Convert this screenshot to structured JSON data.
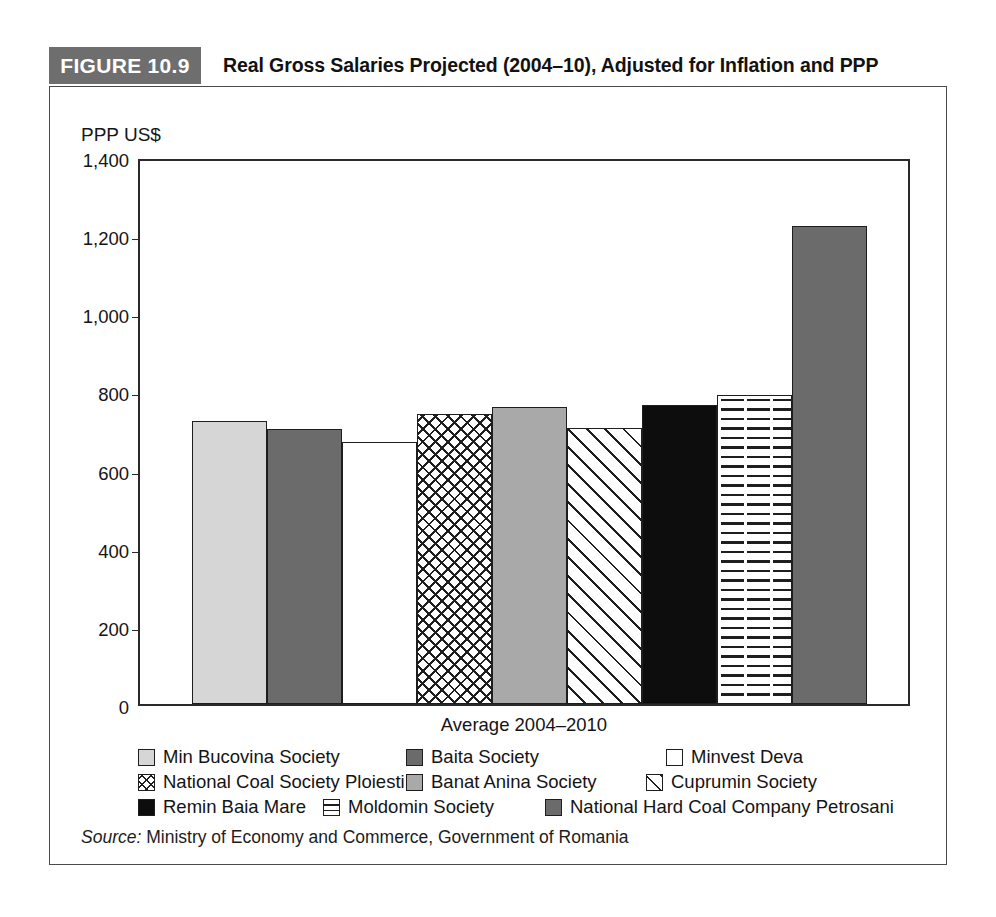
{
  "figure": {
    "tag": "FIGURE 10.9",
    "title": "Real Gross Salaries Projected (2004–10), Adjusted for Inflation and PPP",
    "tag_bg": "#6e6e6e",
    "frame_color": "#4a4a4a"
  },
  "source": {
    "label": "Source:",
    "text": "Ministry of Economy and Commerce, Government of Romania"
  },
  "chart_data": {
    "type": "bar",
    "title": "Real Gross Salaries Projected (2004–10), Adjusted for Inflation and PPP",
    "xlabel": "Average 2004–2010",
    "ylabel": "PPP US$",
    "ylim": [
      0,
      1400
    ],
    "yticks": [
      0,
      200,
      400,
      600,
      800,
      1000,
      1200,
      1400
    ],
    "ytick_labels": [
      "0",
      "200",
      "400",
      "600",
      "800",
      "1,000",
      "1,200",
      "1,400"
    ],
    "grid": false,
    "legend_position": "below",
    "categories": [
      "Min Bucovina Society",
      "Baita Society",
      "Minvest Deva",
      "National Coal Society Ploiesti",
      "Banat Anina Society",
      "Cuprumin Society",
      "Remin Baia Mare",
      "Moldomin Society",
      "National Hard Coal Company Petrosani"
    ],
    "values": [
      725,
      705,
      670,
      743,
      760,
      707,
      765,
      790,
      1223
    ],
    "patterns": [
      "light-gray-solid",
      "dark-gray-solid",
      "white-solid",
      "cross-hatch",
      "mid-gray-solid",
      "diagonal-hatch",
      "black-solid",
      "horizontal-lines",
      "dark-gray-solid"
    ]
  },
  "legend": {
    "rows": [
      [
        {
          "label": "Min Bucovina Society",
          "pattern": "light-gray-solid"
        },
        {
          "label": "Baita Society",
          "pattern": "dark-gray-solid"
        },
        {
          "label": "Minvest Deva",
          "pattern": "white-solid"
        }
      ],
      [
        {
          "label": "National Coal Society Ploiesti",
          "pattern": "cross-hatch"
        },
        {
          "label": "Banat Anina Society",
          "pattern": "mid-gray-solid"
        },
        {
          "label": "Cuprumin Society",
          "pattern": "diagonal-hatch"
        }
      ],
      [
        {
          "label": "Remin Baia Mare",
          "pattern": "black-solid"
        },
        {
          "label": "Moldomin Society",
          "pattern": "horizontal-lines"
        },
        {
          "label": "National Hard Coal Company Petrosani",
          "pattern": "dark-gray-solid"
        }
      ]
    ]
  }
}
